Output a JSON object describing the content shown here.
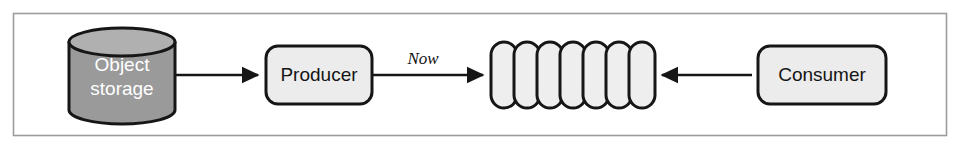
{
  "figure": {
    "type": "flow-diagram",
    "frame": {
      "border_color": "#9c9c9c",
      "background_color": "#ffffff"
    },
    "palette": {
      "stroke": "#161616",
      "node_fill": "#ececec",
      "queue_fill": "#eeeeee",
      "storage_fill": "#9a9a9a",
      "storage_top_fill": "#b0b0b0",
      "storage_text": "#ffffff",
      "node_text": "#151515",
      "frame_border": "#9c9c9c"
    }
  },
  "nodes": {
    "object_storage": {
      "label_line1": "Object",
      "label_line2": "storage",
      "shape": "cylinder",
      "fill": "#9a9a9a",
      "text_color": "#ffffff"
    },
    "producer": {
      "label": "Producer",
      "shape": "rounded-rect",
      "fill": "#ececec",
      "text_color": "#151515"
    },
    "consumer": {
      "label": "Consumer",
      "shape": "rounded-rect",
      "fill": "#ececec",
      "text_color": "#151515"
    },
    "queue": {
      "label": "",
      "shape": "capsule-series",
      "segment_count": 7,
      "fill": "#eeeeee",
      "segments": [
        {
          "index": 1
        },
        {
          "index": 2
        },
        {
          "index": 3
        },
        {
          "index": 4
        },
        {
          "index": 5
        },
        {
          "index": 6
        },
        {
          "index": 7
        }
      ]
    }
  },
  "edges": [
    {
      "id": "storage-to-producer",
      "from": "object_storage",
      "to": "producer",
      "label": "",
      "direction": "right"
    },
    {
      "id": "producer-to-queue",
      "from": "producer",
      "to": "queue",
      "label": "Now",
      "direction": "right"
    },
    {
      "id": "consumer-to-queue",
      "from": "consumer",
      "to": "queue",
      "label": "",
      "direction": "left"
    }
  ]
}
